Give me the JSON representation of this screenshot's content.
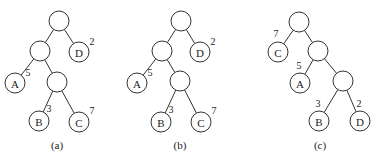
{
  "trees": [
    {
      "caption": "(a)",
      "caption_pos": [
        57,
        149
      ],
      "nodes": [
        {
          "id": "r",
          "x": 59,
          "y": 21,
          "label": ""
        },
        {
          "id": "n1",
          "x": 40,
          "y": 51,
          "label": ""
        },
        {
          "id": "D",
          "x": 79,
          "y": 52,
          "label": "D",
          "weight": "2",
          "wx": 92,
          "wy": 45
        },
        {
          "id": "A",
          "x": 15,
          "y": 83,
          "label": "A",
          "weight": "5",
          "wx": 28,
          "wy": 76
        },
        {
          "id": "n2",
          "x": 57,
          "y": 82,
          "label": ""
        },
        {
          "id": "B",
          "x": 39,
          "y": 121,
          "label": "B",
          "weight": "3",
          "wx": 49,
          "wy": 112
        },
        {
          "id": "C",
          "x": 79,
          "y": 122,
          "label": "C",
          "weight": "7",
          "wx": 92,
          "wy": 114
        }
      ],
      "edges": [
        [
          "r",
          "n1"
        ],
        [
          "r",
          "D"
        ],
        [
          "n1",
          "A"
        ],
        [
          "n1",
          "n2"
        ],
        [
          "n2",
          "B"
        ],
        [
          "n2",
          "C"
        ]
      ]
    },
    {
      "caption": "(b)",
      "caption_pos": [
        180,
        149
      ],
      "nodes": [
        {
          "id": "r",
          "x": 181,
          "y": 21,
          "label": ""
        },
        {
          "id": "n1",
          "x": 162,
          "y": 51,
          "label": ""
        },
        {
          "id": "D",
          "x": 200,
          "y": 52,
          "label": "D",
          "weight": "2",
          "wx": 213,
          "wy": 45
        },
        {
          "id": "A",
          "x": 137,
          "y": 83,
          "label": "A",
          "weight": "5",
          "wx": 150,
          "wy": 76
        },
        {
          "id": "n2",
          "x": 180,
          "y": 81,
          "label": ""
        },
        {
          "id": "B",
          "x": 161,
          "y": 122,
          "label": "B",
          "weight": "3",
          "wx": 171,
          "wy": 113
        },
        {
          "id": "C",
          "x": 201,
          "y": 122,
          "label": "C",
          "weight": "7",
          "wx": 214,
          "wy": 114
        }
      ],
      "edges": [
        [
          "r",
          "n1"
        ],
        [
          "r",
          "D"
        ],
        [
          "n1",
          "A"
        ],
        [
          "n1",
          "n2"
        ],
        [
          "n2",
          "B"
        ],
        [
          "n2",
          "C"
        ]
      ]
    },
    {
      "caption": "(c)",
      "caption_pos": [
        320,
        149
      ],
      "nodes": [
        {
          "id": "r",
          "x": 299,
          "y": 22,
          "label": ""
        },
        {
          "id": "C",
          "x": 278,
          "y": 52,
          "label": "C",
          "weight": "7",
          "wx": 276,
          "wy": 37
        },
        {
          "id": "n1",
          "x": 318,
          "y": 51,
          "label": ""
        },
        {
          "id": "A",
          "x": 300,
          "y": 83,
          "label": "A",
          "weight": "5",
          "wx": 299,
          "wy": 69
        },
        {
          "id": "n2",
          "x": 343,
          "y": 81,
          "label": ""
        },
        {
          "id": "B",
          "x": 319,
          "y": 121,
          "label": "B",
          "weight": "3",
          "wx": 318,
          "wy": 107
        },
        {
          "id": "D",
          "x": 360,
          "y": 121,
          "label": "D",
          "weight": "2",
          "wx": 359,
          "wy": 107
        }
      ],
      "edges": [
        [
          "r",
          "C"
        ],
        [
          "r",
          "n1"
        ],
        [
          "n1",
          "A"
        ],
        [
          "n1",
          "n2"
        ],
        [
          "n2",
          "B"
        ],
        [
          "n2",
          "D"
        ]
      ]
    }
  ],
  "node_radius": 10
}
